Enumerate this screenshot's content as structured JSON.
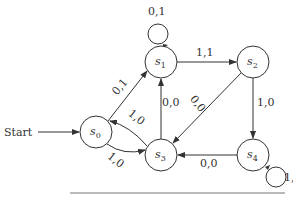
{
  "diagram": {
    "start_label": "Start",
    "states": [
      {
        "id": "s0",
        "name": "s",
        "sub": "0",
        "cx": 96,
        "cy": 132
      },
      {
        "id": "s1",
        "name": "s",
        "sub": "1",
        "cx": 161,
        "cy": 62
      },
      {
        "id": "s2",
        "name": "s",
        "sub": "2",
        "cx": 253,
        "cy": 62
      },
      {
        "id": "s3",
        "name": "s",
        "sub": "3",
        "cx": 161,
        "cy": 155
      },
      {
        "id": "s4",
        "name": "s",
        "sub": "4",
        "cx": 253,
        "cy": 155
      }
    ],
    "transitions": [
      {
        "from": "s0",
        "to": "s1",
        "label": "0,1"
      },
      {
        "from": "s1",
        "to": "s1",
        "label": "0,1"
      },
      {
        "from": "s1",
        "to": "s2",
        "label": "1,1"
      },
      {
        "from": "s2",
        "to": "s3",
        "label": "0,0"
      },
      {
        "from": "s2",
        "to": "s4",
        "label": "1,0"
      },
      {
        "from": "s3",
        "to": "s1",
        "label": "0,0"
      },
      {
        "from": "s3",
        "to": "s0",
        "label": "1,0"
      },
      {
        "from": "s0",
        "to": "s3",
        "label": "1,0"
      },
      {
        "from": "s4",
        "to": "s3",
        "label": "0,0"
      },
      {
        "from": "s4",
        "to": "s4",
        "label": "1,"
      }
    ]
  }
}
